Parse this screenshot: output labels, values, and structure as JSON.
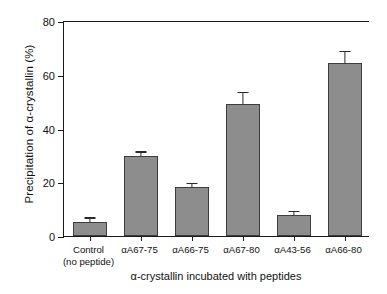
{
  "chart_data": {
    "type": "bar",
    "title": "",
    "xlabel": "α-crystallin incubated with peptides",
    "ylabel": "Precipitation of α-crystallin (%)",
    "ylim": [
      0,
      80
    ],
    "yticks": [
      0,
      20,
      40,
      60,
      80
    ],
    "ytick_labels": [
      "0",
      "20",
      "40",
      "60",
      "80"
    ],
    "grid": false,
    "legend": null,
    "bar_color": "#8d8d8d",
    "bar_edge_color": "#3d3d3d",
    "axis_color": "#1a1a1a",
    "categories": [
      "Control\n(no peptide)",
      "αA67-75",
      "αA66-75",
      "αA67-80",
      "αA43-56",
      "αA66-80"
    ],
    "category_lines": [
      {
        "line1": "Control",
        "line2": "(no peptide)"
      },
      {
        "line1": "αA67-75",
        "line2": ""
      },
      {
        "line1": "αA66-75",
        "line2": ""
      },
      {
        "line1": "αA67-80",
        "line2": ""
      },
      {
        "line1": "αA43-56",
        "line2": ""
      },
      {
        "line1": "αA66-80",
        "line2": ""
      }
    ],
    "values": [
      5.2,
      29.6,
      18.2,
      49.2,
      7.8,
      64.2
    ],
    "errors": [
      1.3,
      1.4,
      1.0,
      4.0,
      1.2,
      4.3
    ]
  }
}
